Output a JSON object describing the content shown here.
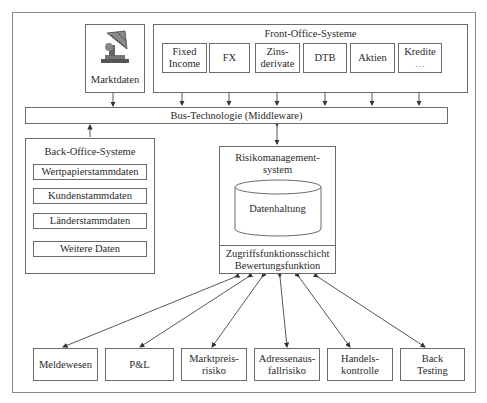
{
  "diagram": {
    "marktdaten": {
      "label": "Marktdaten",
      "icon": "satellite-dish-icon"
    },
    "front_office": {
      "title": "Front-Office-Systeme",
      "items": [
        {
          "line1": "Fixed",
          "line2": "Income"
        },
        {
          "line1": "FX",
          "line2": ""
        },
        {
          "line1": "Zins-",
          "line2": "derivate"
        },
        {
          "line1": "DTB",
          "line2": ""
        },
        {
          "line1": "Aktien",
          "line2": ""
        },
        {
          "line1": "Kredite",
          "line2": "…"
        }
      ]
    },
    "bus": {
      "label": "Bus-Technologie (Middleware)"
    },
    "back_office": {
      "title": "Back-Office-Systeme",
      "items": [
        "Wertpapierstammdaten",
        "Kundenstammdaten",
        "Länderstammdaten",
        "Weitere Daten"
      ]
    },
    "risk_system": {
      "title_line1": "Risikomanagement-",
      "title_line2": "system",
      "database": "Datenhaltung",
      "access_line1": "Zugriffsfunktionsschicht",
      "access_line2": "Bewertungsfunktion"
    },
    "outputs": [
      {
        "line1": "Meldewesen",
        "line2": ""
      },
      {
        "line1": "P&L",
        "line2": ""
      },
      {
        "line1": "Marktpreis-",
        "line2": "risiko"
      },
      {
        "line1": "Adressenaus-",
        "line2": "fallrisiko"
      },
      {
        "line1": "Handels-",
        "line2": "kontrolle"
      },
      {
        "line1": "Back",
        "line2": "Testing"
      }
    ]
  }
}
